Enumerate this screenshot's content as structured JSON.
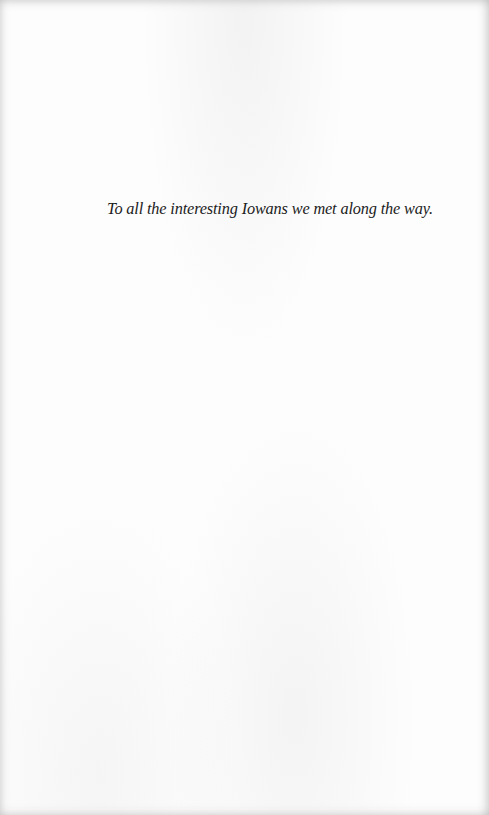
{
  "page": {
    "type": "dedication",
    "dedication_text": "To all the interesting Iowans we met along the way.",
    "colors": {
      "paper": "#fdfdfd",
      "text": "#1c1c1c"
    }
  }
}
